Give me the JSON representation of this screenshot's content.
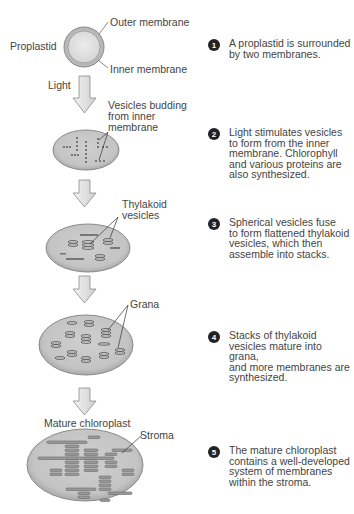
{
  "labels": {
    "proplastid": "Proplastid",
    "outer_membrane": "Outer membrane",
    "inner_membrane": "Inner membrane",
    "light": "Light",
    "vesicles_budding": [
      "Vesicles budding",
      "from inner",
      "membrane"
    ],
    "thylakoid_vesicles": [
      "Thylakoid",
      "vesicles"
    ],
    "grana": "Grana",
    "mature_chloroplast": "Mature chloroplast",
    "stroma": "Stroma"
  },
  "steps": [
    {
      "number": "1",
      "text": [
        "A proplastid is surrounded",
        "by two membranes."
      ]
    },
    {
      "number": "2",
      "text": [
        "Light stimulates vesicles",
        "to form from the inner",
        "membrane. Chlorophyll",
        "and various proteins are",
        "also synthesized."
      ]
    },
    {
      "number": "3",
      "text": [
        "Spherical vesicles fuse",
        "to form flattened thylakoid",
        "vesicles, which then",
        "assemble into stacks."
      ]
    },
    {
      "number": "4",
      "text": [
        "Stacks of thylakoid",
        "vesicles mature into grana,",
        "and more membranes are",
        "synthesized."
      ]
    },
    {
      "number": "5",
      "text": [
        "The mature chloroplast",
        "contains a well-developed",
        "system of membranes",
        "within the stroma."
      ]
    }
  ],
  "colors": {
    "plastid_fill": "#c9c9c9",
    "plastid_edge": "#9a9a9a",
    "membrane": "#6e6e6e",
    "arrow_fill": "#e2e2e2",
    "badge": "#222222"
  }
}
